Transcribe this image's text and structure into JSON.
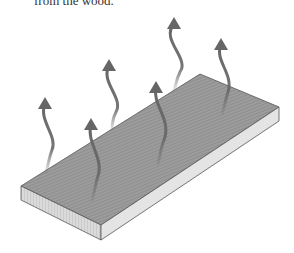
{
  "caption": "from the wood.",
  "figure": {
    "arrows_meaning": "moisture-evaporating",
    "colors": {
      "top_face": "#9a9a9a",
      "front_face": "#d8d8d8",
      "side_face": "#e6e6e6",
      "edge": "#555555",
      "arrow": "#666666"
    },
    "arrow_count": 6
  }
}
